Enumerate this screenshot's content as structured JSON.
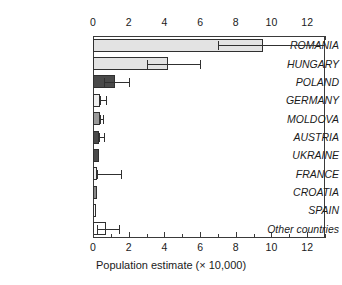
{
  "chart_data": {
    "type": "bar",
    "orientation": "horizontal",
    "title": "",
    "xlabel": "Population estimate (× 10,000)",
    "ylabel": "",
    "xlim": [
      0,
      13
    ],
    "xticks": [
      0,
      2,
      4,
      6,
      8,
      10,
      12
    ],
    "xtick_labels": [
      "0",
      "2",
      "4",
      "6",
      "8",
      "10",
      "12"
    ],
    "minor_tick_step": 1,
    "grid": false,
    "legend": null,
    "axes": [
      "top",
      "bottom"
    ],
    "categories": [
      "ROMANIA",
      "HUNGARY",
      "POLAND",
      "GERMANY",
      "MOLDOVA",
      "AUSTRIA",
      "UKRAINE",
      "FRANCE",
      "CROATIA",
      "SPAIN",
      "Other countries"
    ],
    "values": [
      9.5,
      4.2,
      1.25,
      0.42,
      0.4,
      0.36,
      0.35,
      0.25,
      0.25,
      0.18,
      0.72
    ],
    "error_low": [
      7.0,
      3.0,
      0.62,
      0.42,
      0.4,
      0.36,
      0.35,
      0.25,
      0.25,
      0.18,
      0.2
    ],
    "error_high": [
      13.0,
      6.0,
      2.0,
      0.72,
      0.55,
      0.62,
      0.35,
      1.55,
      0.25,
      0.18,
      1.45
    ],
    "bar_colors": [
      "#e3e3e3",
      "#e3e3e3",
      "#4a4a4a",
      "#efefef",
      "#9a9a9a",
      "#4a4a4a",
      "#4a4a4a",
      "#ededed",
      "#8a8a8a",
      "#fafafa",
      "#ffffff"
    ]
  }
}
